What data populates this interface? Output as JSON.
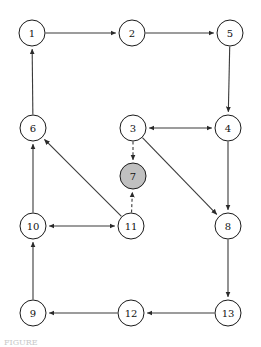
{
  "figure": {
    "caption_fragment": "FIGURE",
    "width": 261,
    "height": 347
  },
  "style": {
    "node_fill_default": "#ffffff",
    "node_fill_highlight": "#c0c0c0",
    "node_stroke": "#1a1a1a",
    "edge_stroke": "#3a3a3a",
    "label_color": "#111111",
    "node_radius": 13
  },
  "chart_data": {
    "type": "diagram",
    "subtype": "directed-graph",
    "node_count": 13,
    "edge_count": 16,
    "nodes": [
      {
        "id": "1",
        "label": "1",
        "x": 32,
        "y": 33,
        "fill": "#ffffff",
        "highlighted": false
      },
      {
        "id": "2",
        "label": "2",
        "x": 132,
        "y": 33,
        "fill": "#ffffff",
        "highlighted": false
      },
      {
        "id": "5",
        "label": "5",
        "x": 230,
        "y": 33,
        "fill": "#ffffff",
        "highlighted": false
      },
      {
        "id": "6",
        "label": "6",
        "x": 33,
        "y": 128,
        "fill": "#ffffff",
        "highlighted": false
      },
      {
        "id": "3",
        "label": "3",
        "x": 133,
        "y": 128,
        "fill": "#ffffff",
        "highlighted": false
      },
      {
        "id": "4",
        "label": "4",
        "x": 228,
        "y": 128,
        "fill": "#ffffff",
        "highlighted": false
      },
      {
        "id": "7",
        "label": "7",
        "x": 133,
        "y": 176,
        "fill": "#c0c0c0",
        "highlighted": true
      },
      {
        "id": "10",
        "label": "10",
        "x": 33,
        "y": 226,
        "fill": "#ffffff",
        "highlighted": false
      },
      {
        "id": "11",
        "label": "11",
        "x": 131,
        "y": 226,
        "fill": "#ffffff",
        "highlighted": false
      },
      {
        "id": "8",
        "label": "8",
        "x": 228,
        "y": 226,
        "fill": "#ffffff",
        "highlighted": false
      },
      {
        "id": "9",
        "label": "9",
        "x": 33,
        "y": 313,
        "fill": "#ffffff",
        "highlighted": false
      },
      {
        "id": "12",
        "label": "12",
        "x": 131,
        "y": 313,
        "fill": "#ffffff",
        "highlighted": false
      },
      {
        "id": "13",
        "label": "13",
        "x": 228,
        "y": 313,
        "fill": "#ffffff",
        "highlighted": false
      }
    ],
    "edges": [
      {
        "from": "1",
        "to": "2",
        "style": "solid",
        "direction": "forward"
      },
      {
        "from": "2",
        "to": "5",
        "style": "solid",
        "direction": "forward"
      },
      {
        "from": "5",
        "to": "4",
        "style": "solid",
        "direction": "forward"
      },
      {
        "from": "3",
        "to": "4",
        "style": "solid",
        "direction": "both"
      },
      {
        "from": "6",
        "to": "1",
        "style": "solid",
        "direction": "forward"
      },
      {
        "from": "3",
        "to": "7",
        "style": "dashed",
        "direction": "forward"
      },
      {
        "from": "11",
        "to": "7",
        "style": "dashed",
        "direction": "forward"
      },
      {
        "from": "3",
        "to": "8",
        "style": "solid",
        "direction": "forward"
      },
      {
        "from": "4",
        "to": "8",
        "style": "solid",
        "direction": "forward"
      },
      {
        "from": "11",
        "to": "6",
        "style": "solid",
        "direction": "forward"
      },
      {
        "from": "10",
        "to": "11",
        "style": "solid",
        "direction": "both"
      },
      {
        "from": "10",
        "to": "6",
        "style": "solid",
        "direction": "forward"
      },
      {
        "from": "9",
        "to": "10",
        "style": "solid",
        "direction": "forward"
      },
      {
        "from": "8",
        "to": "13",
        "style": "solid",
        "direction": "forward"
      },
      {
        "from": "13",
        "to": "12",
        "style": "solid",
        "direction": "forward"
      },
      {
        "from": "12",
        "to": "9",
        "style": "solid",
        "direction": "forward"
      }
    ]
  }
}
